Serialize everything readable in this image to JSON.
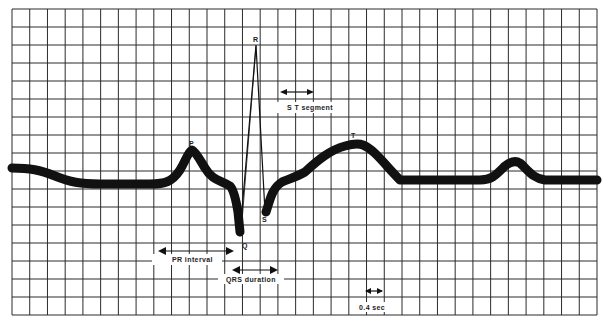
{
  "diagram": {
    "type": "ecg-waveform",
    "grid": {
      "left": 12,
      "top": 9,
      "right": 597,
      "bottom": 315,
      "cols": 33,
      "rows": 17,
      "line_color": "#2b2b2b",
      "background": "#ffffff"
    },
    "trace_color": "#111111",
    "wave_labels": {
      "P": "P",
      "Q": "Q",
      "R": "R",
      "S": "S",
      "T": "T"
    },
    "annotations": {
      "st_segment": "S T segment",
      "pr_interval": "PR interval",
      "qrs_duration": "QRS duration",
      "time_scale": "0.4 sec"
    }
  }
}
